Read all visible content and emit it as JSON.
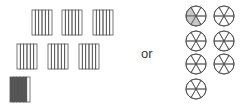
{
  "diagram": {
    "separator_label": "or",
    "colors": {
      "stroke": "#555555",
      "rect_fill_shaded": "#555555",
      "circle_fill_shaded": "#c8c8c8",
      "background": "#ffffff"
    },
    "rectangles": {
      "parts_each": 6,
      "items": [
        {
          "x": 32,
          "y": 10,
          "shaded": 0
        },
        {
          "x": 62,
          "y": 10,
          "shaded": 0
        },
        {
          "x": 93,
          "y": 10,
          "shaded": 0
        },
        {
          "x": 17,
          "y": 44,
          "shaded": 0
        },
        {
          "x": 48,
          "y": 44,
          "shaded": 0
        },
        {
          "x": 79,
          "y": 44,
          "shaded": 0
        },
        {
          "x": 10,
          "y": 77,
          "shaded": 5
        }
      ]
    },
    "circles": {
      "parts_each": 6,
      "items": [
        {
          "cx": 196,
          "cy": 16,
          "shaded": 3
        },
        {
          "cx": 224,
          "cy": 16,
          "shaded": 0
        },
        {
          "cx": 196,
          "cy": 41,
          "shaded": 0
        },
        {
          "cx": 224,
          "cy": 41,
          "shaded": 0
        },
        {
          "cx": 196,
          "cy": 64,
          "shaded": 0
        },
        {
          "cx": 224,
          "cy": 64,
          "shaded": 0
        },
        {
          "cx": 196,
          "cy": 89,
          "shaded": 0
        }
      ]
    }
  }
}
